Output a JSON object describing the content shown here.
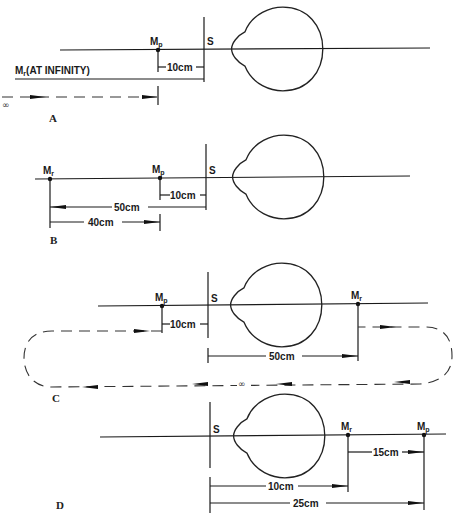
{
  "figure": {
    "panels": [
      {
        "id": "A",
        "label": "A",
        "s_label": "S",
        "mp_label": "M",
        "mp_sub": "p",
        "mr_label": "M",
        "mr_sub": "r",
        "mr_note": "(AT INFINITY)",
        "dims": [
          {
            "label": "10cm",
            "from": "Mp",
            "to": "S"
          }
        ],
        "infinity_symbol": "∞"
      },
      {
        "id": "B",
        "label": "B",
        "s_label": "S",
        "mp_label": "M",
        "mp_sub": "p",
        "mr_label": "M",
        "mr_sub": "r",
        "dims": [
          {
            "label": "10cm",
            "from": "Mp",
            "to": "S"
          },
          {
            "label": "50cm",
            "from": "S",
            "to": "Mr"
          },
          {
            "label": "40cm",
            "from": "Mr",
            "to": "Mp"
          }
        ]
      },
      {
        "id": "C",
        "label": "C",
        "s_label": "S",
        "mp_label": "M",
        "mp_sub": "p",
        "mr_label": "M",
        "mr_sub": "r",
        "dims": [
          {
            "label": "10cm",
            "from": "Mp",
            "to": "S"
          },
          {
            "label": "50cm",
            "from": "S",
            "to": "Mr"
          }
        ],
        "infinity_symbol": "∞"
      },
      {
        "id": "D",
        "label": "D",
        "s_label": "S",
        "mp_label": "M",
        "mp_sub": "p",
        "mr_label": "M",
        "mr_sub": "r",
        "dims": [
          {
            "label": "15cm",
            "from": "Mr",
            "to": "Mp"
          },
          {
            "label": "10cm",
            "from": "S",
            "to": "Mr"
          },
          {
            "label": "25cm",
            "from": "S",
            "to": "Mp"
          }
        ]
      }
    ]
  }
}
